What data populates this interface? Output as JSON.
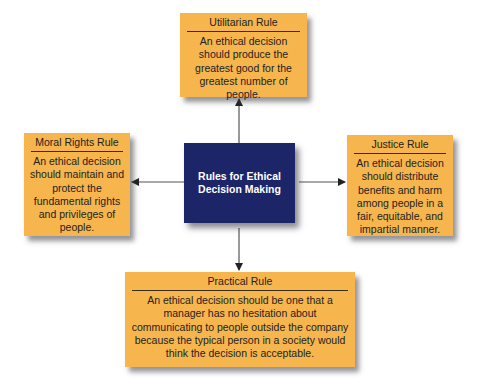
{
  "center": {
    "title": "Rules for Ethical Decision Making"
  },
  "rules": {
    "utilitarian": {
      "title": "Utilitarian Rule",
      "body": "An ethical decision should produce the greatest good for the greatest number of people."
    },
    "moral_rights": {
      "title": "Moral Rights Rule",
      "body": "An ethical decision should maintain and protect the fundamental rights and privileges of people."
    },
    "justice": {
      "title": "Justice Rule",
      "body": "An ethical decision should distribute benefits and harm among people in a fair, equitable, and impartial manner."
    },
    "practical": {
      "title": "Practical Rule",
      "body": "An ethical decision should be one that a manager has no hesitation about communicating to people outside the company because the typical person in a society would think the decision is acceptable."
    }
  },
  "colors": {
    "rule_box": "#f6b54d",
    "center_box": "#1d2569",
    "arrow": "#333333"
  }
}
